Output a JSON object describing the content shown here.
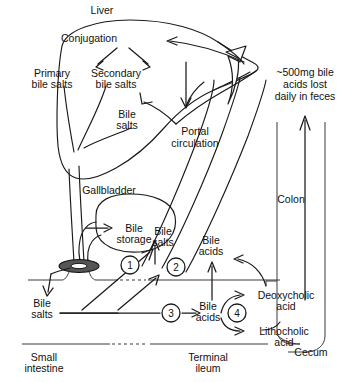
{
  "diagram": {
    "type": "biological-pathway-diagram",
    "background_color": "#ffffff",
    "line_color": "#1a1a1a",
    "labels": {
      "liver": "Liver",
      "conjugation": "Conjugation",
      "primary_bile_salts_l1": "Primary",
      "primary_bile_salts_l2": "bile salts",
      "secondary_bile_salts_l1": "Secondary",
      "secondary_bile_salts_l2": "bile salts",
      "bile_salts_liver_l1": "Bile",
      "bile_salts_liver_l2": "salts",
      "gallbladder": "Gallbladder",
      "bile_storage_l1": "Bile",
      "bile_storage_l2": "storage",
      "portal_circulation_l1": "Portal",
      "portal_circulation_l2": "circulation",
      "feces_loss_l1": "~500mg bile",
      "feces_loss_l2": "acids lost",
      "feces_loss_l3": "daily in feces",
      "colon": "Colon",
      "cecum": "Cecum",
      "bile_salts_duodenum_l1": "Bile",
      "bile_salts_duodenum_l2": "salts",
      "bile_salts_ileum_l1": "Bile",
      "bile_salts_ileum_l2": "salts",
      "bile_acids_upper_l1": "Bile",
      "bile_acids_upper_l2": "acids",
      "bile_acids_lower_l1": "Bile",
      "bile_acids_lower_l2": "acids",
      "deoxycholic_acid_l1": "Deoxycholic",
      "deoxycholic_acid_l2": "acid",
      "lithocholic_acid_l1": "Lithocholic",
      "lithocholic_acid_l2": "acid",
      "small_intestine_l1": "Small",
      "small_intestine_l2": "intestine",
      "terminal_ileum_l1": "Terminal",
      "terminal_ileum_l2": "ileum"
    },
    "step_markers": [
      {
        "id": "1",
        "label": "1"
      },
      {
        "id": "2",
        "label": "2"
      },
      {
        "id": "3",
        "label": "3"
      },
      {
        "id": "4",
        "label": "4"
      }
    ]
  }
}
